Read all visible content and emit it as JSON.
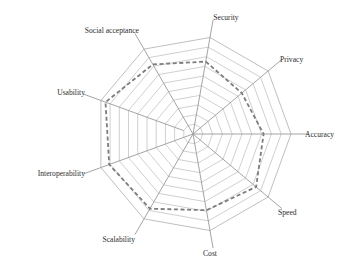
{
  "chart_data": {
    "type": "radar",
    "title": "",
    "axes": [
      "Security",
      "Privacy",
      "Accuracy",
      "Speed",
      "Cost",
      "Scalability",
      "Interoperability",
      "Usability",
      "Social acceptance"
    ],
    "rmax": 10,
    "rings": 10,
    "grid": true,
    "legend": "none",
    "series": [
      {
        "name": "Rating",
        "style": "dashed",
        "color": "#7d7d7d",
        "values": [
          7.5,
          6.5,
          7.2,
          8.4,
          7.9,
          8.8,
          9.1,
          9.5,
          8.2
        ]
      }
    ]
  },
  "layout": {
    "center": [
      193,
      134
    ],
    "radius": 98,
    "spoke_length": 116,
    "start_angle_deg": -80,
    "label_positions": [
      {
        "x": 226,
        "y": 20,
        "anchor": "middle"
      },
      {
        "x": 280,
        "y": 62,
        "anchor": "start"
      },
      {
        "x": 305,
        "y": 137,
        "anchor": "start"
      },
      {
        "x": 278,
        "y": 215,
        "anchor": "start"
      },
      {
        "x": 210,
        "y": 256,
        "anchor": "middle"
      },
      {
        "x": 135,
        "y": 242,
        "anchor": "end"
      },
      {
        "x": 85,
        "y": 176,
        "anchor": "end"
      },
      {
        "x": 85,
        "y": 95,
        "anchor": "end"
      },
      {
        "x": 139,
        "y": 33,
        "anchor": "end"
      }
    ]
  }
}
